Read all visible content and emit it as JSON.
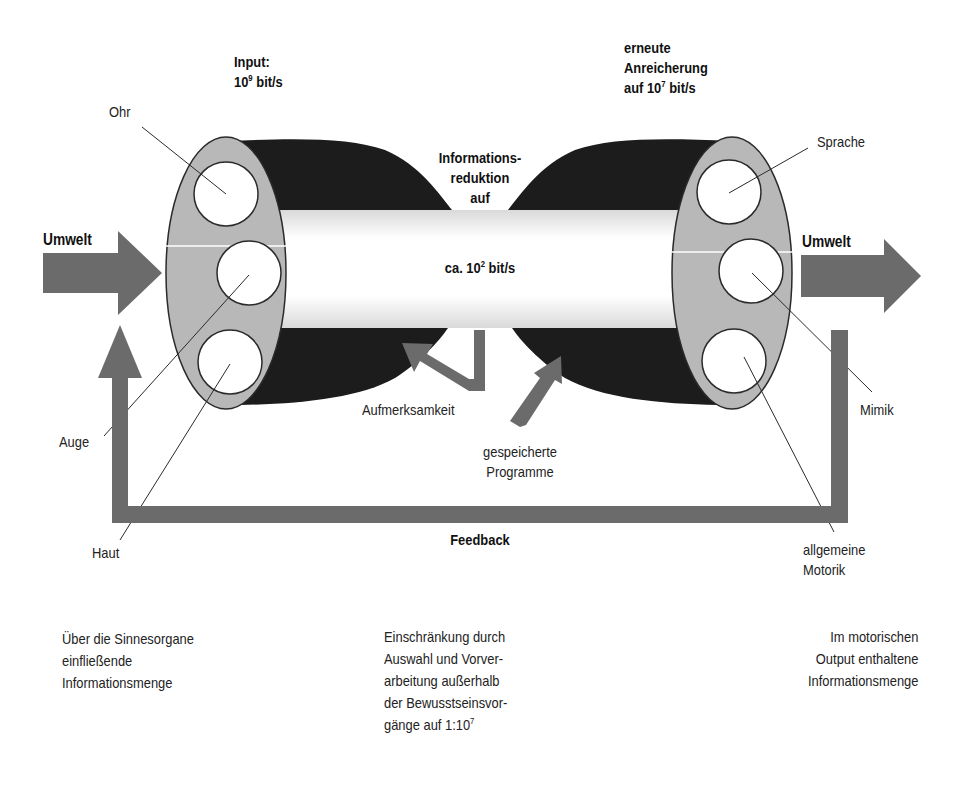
{
  "diagram": {
    "colors": {
      "arrow_gray": "#6b6b6b",
      "ellipse_gray": "#b8b8b8",
      "cone_black": "#1c1c1c",
      "tube_light": "#e6e6e6",
      "outline": "#2a2a2a",
      "background": "#ffffff"
    },
    "input": {
      "line1": "Input:",
      "value_base": "10",
      "value_exp": "9",
      "value_unit": " bit/s"
    },
    "enrichment": {
      "line1": "erneute",
      "line2": "Anreicherung",
      "value_prefix": "auf 10",
      "value_exp": "7",
      "value_unit": " bit/s"
    },
    "reduction": {
      "line1": "Informations-",
      "line2": "reduktion",
      "line3": "auf",
      "value_prefix": "ca. 10",
      "value_exp": "2",
      "value_unit": " bit/s"
    },
    "left_ellipse": {
      "labels": {
        "ear": "Ohr",
        "eye": "Auge",
        "skin": "Haut"
      }
    },
    "right_ellipse": {
      "labels": {
        "speech": "Sprache",
        "facial": "Mimik",
        "motor_line1": "allgemeine",
        "motor_line2": "Motorik"
      }
    },
    "environment_in": "Umwelt",
    "environment_out": "Umwelt",
    "attention": "Aufmerksamkeit",
    "stored_programs": {
      "line1": "gespeicherte",
      "line2": "Programme"
    },
    "feedback": "Feedback"
  },
  "captions": {
    "left": {
      "line1": "Über die Sinnesorgane",
      "line2": "einfließende",
      "line3": "Informationsmenge"
    },
    "center": {
      "line1": "Einschränkung durch",
      "line2": "Auswahl und Vorver-",
      "line3": "arbeitung außerhalb",
      "line4": "der Bewusstseinsvor-",
      "line5_prefix": "gänge auf 1:10",
      "line5_exp": "7"
    },
    "right": {
      "line1": "Im motorischen",
      "line2": "Output enthaltene",
      "line3": "Informationsmenge"
    }
  }
}
